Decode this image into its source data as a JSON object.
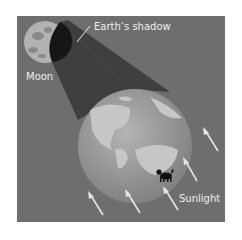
{
  "diagram": {
    "labels": {
      "shadow": "Earth’s shadow",
      "moon": "Moon",
      "sunlight": "Sunlight"
    },
    "colors": {
      "background": "#6e6e6e",
      "shadow_cone": "#3a3a3a",
      "earth": "#9a9a9a",
      "land": "#c4c4c4",
      "moon": "#b0b0b0",
      "arrows": "#e8e8e8"
    }
  }
}
